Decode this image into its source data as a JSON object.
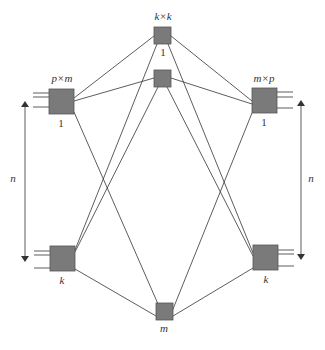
{
  "diagram": {
    "type": "three-stage Clos network",
    "colors": {
      "box_fill": "#7a7a7a",
      "box_stroke": "#555555",
      "line": "#333333",
      "background": "#ffffff"
    },
    "ingress": {
      "size_label": "p×m",
      "first_label": "1",
      "last_label": "k"
    },
    "middle": {
      "size_label": "k×k",
      "first_label": "1",
      "last_label": "m"
    },
    "egress": {
      "size_label": "m×p",
      "first_label": "1",
      "last_label": "k"
    },
    "left_dimension": {
      "label": "n"
    },
    "right_dimension": {
      "label": "n"
    }
  }
}
